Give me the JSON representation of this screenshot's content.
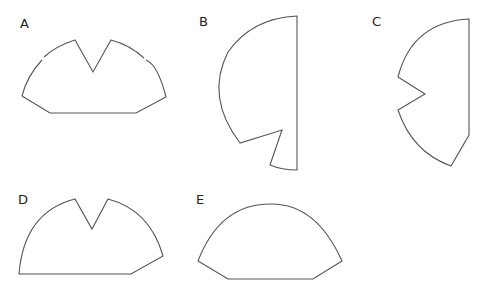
{
  "figure": {
    "stroke_color": "#555555",
    "options": [
      {
        "label": "A",
        "x": 20,
        "y": 16
      },
      {
        "label": "B",
        "x": 199,
        "y": 15
      },
      {
        "label": "C",
        "x": 372,
        "y": 15
      },
      {
        "label": "D",
        "x": 18,
        "y": 193
      },
      {
        "label": "E",
        "x": 196,
        "y": 193
      }
    ]
  }
}
